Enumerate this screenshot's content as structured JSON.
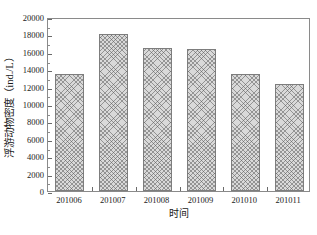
{
  "chart_data": {
    "type": "bar",
    "title": "",
    "categories": [
      "201006",
      "201007",
      "201008",
      "201009",
      "201010",
      "201011"
    ],
    "values": [
      13400,
      18000,
      16400,
      16300,
      13400,
      12300
    ],
    "series": [
      {
        "name": "浮游动物密度",
        "values": [
          13400,
          18000,
          16400,
          16300,
          13400,
          12300
        ]
      }
    ],
    "xlabel": "时间",
    "ylabel": "浮游动物密度（ind./L）",
    "ylabel_text": "浮游动物密度",
    "ylabel_unit": "(ind./L)",
    "ylim": [
      0,
      20000
    ],
    "ytick_step": 2000,
    "yticks": [
      0,
      2000,
      4000,
      6000,
      8000,
      10000,
      12000,
      14000,
      16000,
      18000,
      20000
    ],
    "ytick_labels": [
      "0",
      "2000",
      "4000",
      "6000",
      "8000",
      "10000",
      "12000",
      "14000",
      "16000",
      "18000",
      "20000"
    ],
    "grid": false,
    "legend": null,
    "legend_position": "none",
    "bar_fill": "#d9d9d9",
    "bar_hatch": "crosshatch",
    "bar_edge_color": "#7d7d7d",
    "frame_color": "#8a8a8a",
    "background": "#ffffff"
  }
}
